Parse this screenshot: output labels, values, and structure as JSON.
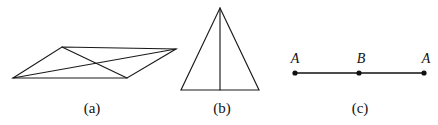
{
  "figure": {
    "width": 438,
    "height": 125,
    "background_color": "#ffffff",
    "stroke_color": "#1a1a1a",
    "panels": [
      {
        "id": "panel-a",
        "caption": "(a)",
        "caption_x": 92,
        "caption_y": 113,
        "shape": "parallelogram-with-diagonals",
        "vertices": {
          "left": [
            13,
            78
          ],
          "top": [
            62,
            47
          ],
          "right": [
            176,
            49
          ],
          "bottom": [
            127,
            78
          ]
        },
        "outline_points": "13,78 62,47 176,49 127,78",
        "diagonals": [
          {
            "name": "diagonal-left-right",
            "from": [
              13,
              78
            ],
            "to": [
              176,
              49
            ]
          },
          {
            "name": "diagonal-top-bottom",
            "from": [
              62,
              47
            ],
            "to": [
              127,
              78
            ]
          }
        ]
      },
      {
        "id": "panel-b",
        "caption": "(b)",
        "caption_x": 222,
        "caption_y": 113,
        "shape": "isosceles-triangle-with-median",
        "vertices": {
          "apex": [
            220,
            8
          ],
          "base_left": [
            181,
            90
          ],
          "base_right": [
            259,
            90
          ]
        },
        "outline_points": "220,8 259,90 181,90",
        "median": {
          "name": "median-line",
          "from": [
            220,
            8
          ],
          "to": [
            220,
            90
          ]
        }
      },
      {
        "id": "panel-c",
        "caption": "(c)",
        "caption_x": 360,
        "caption_y": 113,
        "shape": "segment-with-three-points",
        "segment": {
          "from": [
            295,
            73
          ],
          "to": [
            424,
            73
          ]
        },
        "points": [
          {
            "label": "A",
            "x": 295,
            "y": 73,
            "label_x": 295,
            "label_y": 63
          },
          {
            "label": "B",
            "x": 359,
            "y": 73,
            "label_x": 361,
            "label_y": 63
          },
          {
            "label": "A",
            "x": 424,
            "y": 73,
            "label_x": 426,
            "label_y": 63
          }
        ],
        "dot_radius": 2.6
      }
    ]
  }
}
